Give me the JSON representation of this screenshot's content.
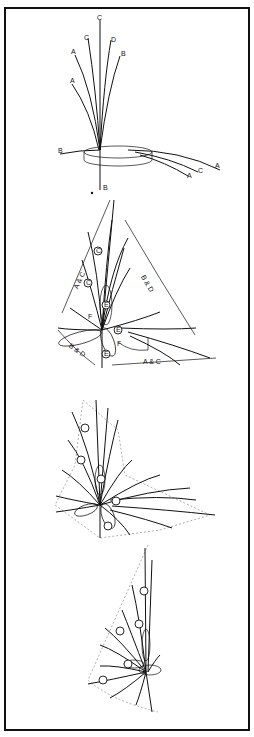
{
  "figure": {
    "type": "floral-arrangement-line-diagrams",
    "border": "#111111",
    "background": "#ffffff",
    "panels": [
      {
        "name": "fan-elevation",
        "stem_labels_top": [
          "C",
          "C",
          "D",
          "A",
          "B",
          "A"
        ],
        "stem_labels_side": [
          "B",
          "A",
          "C",
          "A"
        ],
        "stem_label_bottom": "B"
      },
      {
        "name": "placement-plan",
        "dimension_labels": [
          "A & C",
          "B & D",
          "B & D",
          "A & C"
        ],
        "circle_labels": [
          "C",
          "C",
          "E",
          "E",
          "E"
        ],
        "marker_labels": [
          "F",
          "F"
        ]
      },
      {
        "name": "filled-plan",
        "circle_count": 6
      },
      {
        "name": "side-profile",
        "circle_count": 5
      }
    ]
  }
}
